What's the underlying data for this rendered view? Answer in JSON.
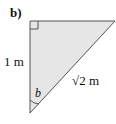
{
  "figure": {
    "part_label": "b)",
    "side_label": "1 m",
    "hypotenuse_label": "√2 m",
    "angle_label": "b",
    "fill_color": "#e6e6e6",
    "stroke_color": "#555555"
  }
}
